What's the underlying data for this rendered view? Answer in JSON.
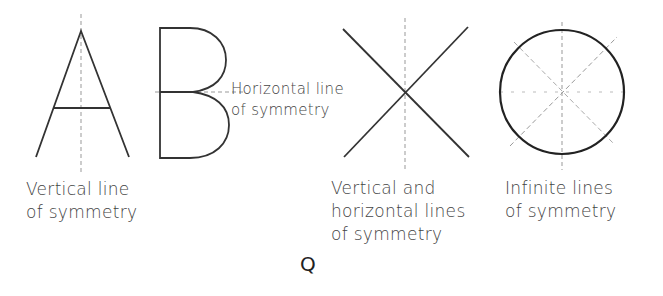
{
  "figures": [
    {
      "letter": "A",
      "caption_line1": "Vertical line",
      "caption_line2": "of symmetry"
    },
    {
      "letter": "B",
      "caption_line1": "Horizontal line",
      "caption_line2": "of symmetry"
    },
    {
      "letter": "X",
      "caption_line1": "Vertical and",
      "caption_line2": "horizontal lines",
      "caption_line3": "of symmetry"
    },
    {
      "letter": "O",
      "caption_line1": "Infinite lines",
      "caption_line2": "of symmetry"
    }
  ],
  "figure_label": "Q",
  "colors": {
    "stroke": "#222222",
    "dash": "#999999",
    "text": "#444444"
  }
}
